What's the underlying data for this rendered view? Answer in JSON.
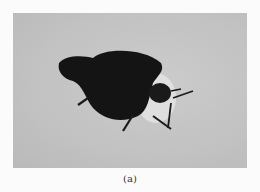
{
  "figure": {
    "caption": "(a)"
  }
}
